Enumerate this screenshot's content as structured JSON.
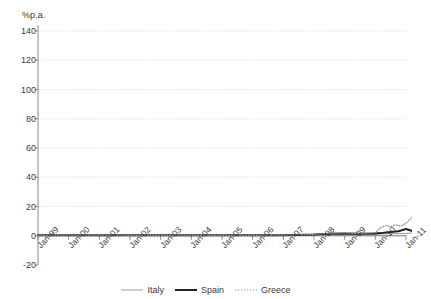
{
  "chart_data": {
    "type": "line",
    "title": "",
    "subtitle": "",
    "xlabel": "",
    "ylabel": "%p.a.",
    "unit_label": "%p.a.",
    "ylim": [
      -20,
      140
    ],
    "yticks": [
      140,
      120,
      100,
      80,
      60,
      40,
      20,
      0,
      -20
    ],
    "grid": true,
    "legend_position": "bottom",
    "x_tick_labels": [
      "Jan-99",
      "Jan-00",
      "Jan-01",
      "Jan-02",
      "Jan-03",
      "Jan-04",
      "Jan-05",
      "Jan-06",
      "Jan-07",
      "Jan-08",
      "Jan-09",
      "Jan-10",
      "Jan-11"
    ],
    "xlim_labels": [
      "Jan-99",
      "Jan-11"
    ],
    "annotations": [
      {
        "text": "March 2010",
        "x": "Mar-2010",
        "style": "vertical-dashed-line"
      }
    ],
    "series": [
      {
        "name": "Italy",
        "color": "#9a9a9a",
        "style": "solid",
        "width": 1,
        "x": [
          "Jan-99",
          "Jan-00",
          "Jan-01",
          "Jan-02",
          "Jan-03",
          "Jan-04",
          "Jan-05",
          "Jan-06",
          "Jan-07",
          "Jan-08",
          "Jul-08",
          "Jan-09",
          "Jul-09",
          "Jan-10",
          "Mar-10",
          "Jul-10",
          "Jan-11",
          "Jul-11",
          "Dec-11"
        ],
        "values": [
          0.2,
          0.3,
          0.3,
          0.2,
          0.2,
          0.2,
          0.2,
          0.2,
          0.3,
          0.7,
          1.0,
          1.2,
          1.0,
          1.1,
          1.2,
          1.4,
          1.6,
          2.2,
          3.2
        ]
      },
      {
        "name": "Spain",
        "color": "#222222",
        "style": "solid",
        "width": 2,
        "x": [
          "Jan-99",
          "Jan-00",
          "Jan-01",
          "Jan-02",
          "Jan-03",
          "Jan-04",
          "Jan-05",
          "Jan-06",
          "Jan-07",
          "Jan-08",
          "Jul-08",
          "Jan-09",
          "Jul-09",
          "Jan-10",
          "Mar-10",
          "Jul-10",
          "Oct-10",
          "Jan-11",
          "Apr-11",
          "Jul-11",
          "Oct-11",
          "Dec-11"
        ],
        "values": [
          0.3,
          0.4,
          0.4,
          0.3,
          0.3,
          0.3,
          0.3,
          0.3,
          0.4,
          0.9,
          1.4,
          1.6,
          1.3,
          1.5,
          1.8,
          2.6,
          3.1,
          4.6,
          3.0,
          3.4,
          4.0,
          5.2
        ]
      },
      {
        "name": "Greece",
        "color": "#8f8f8f",
        "style": "dotted",
        "width": 1.2,
        "x": [
          "Jan-99",
          "Jan-00",
          "Jan-01",
          "Jan-02",
          "Jan-03",
          "Jan-04",
          "Jan-05",
          "Jan-06",
          "Jan-07",
          "Jan-08",
          "Jul-08",
          "Jan-09",
          "Jul-09",
          "Jan-10",
          "Mar-10",
          "May-10",
          "Jul-10",
          "Sep-10",
          "Nov-10",
          "Jan-11",
          "Mar-11",
          "May-11",
          "Jul-11",
          "Sep-11",
          "Oct-11",
          "Nov-11",
          "Dec-11"
        ],
        "values": [
          0.3,
          0.4,
          0.4,
          0.3,
          0.3,
          0.3,
          0.3,
          0.3,
          0.4,
          1.0,
          1.6,
          1.9,
          1.5,
          2.2,
          5.5,
          7.0,
          6.2,
          7.5,
          6.6,
          8.5,
          12.0,
          18.0,
          24.0,
          55.0,
          85.0,
          112.0,
          123.0
        ]
      }
    ],
    "peak_value": 123
  },
  "legend": {
    "items": [
      {
        "label": "Italy"
      },
      {
        "label": "Spain"
      },
      {
        "label": "Greece"
      }
    ]
  }
}
